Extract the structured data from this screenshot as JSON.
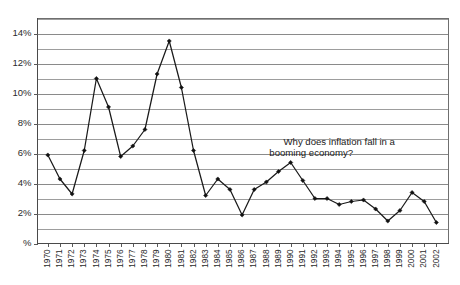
{
  "chart_data": {
    "type": "line",
    "title": "",
    "subtitle": "",
    "xlabel": "",
    "ylabel": "",
    "ylim": [
      0,
      15
    ],
    "ytick_values": [
      0,
      2,
      4,
      6,
      8,
      10,
      12,
      14
    ],
    "ytick_labels": [
      "%",
      "2%",
      "4%",
      "6%",
      "8%",
      "10%",
      "12%",
      "14%"
    ],
    "yminor_values": [
      1,
      3,
      5,
      7,
      9,
      11,
      13,
      15
    ],
    "grid": true,
    "grid_axis": "y",
    "legend": false,
    "legend_position": "none",
    "marker": "diamond",
    "categories": [
      "1970",
      "1971",
      "1972",
      "1973",
      "1974",
      "1975",
      "1976",
      "1977",
      "1978",
      "1979",
      "1980",
      "1981",
      "1982",
      "1983",
      "1984",
      "1985",
      "1986",
      "1987",
      "1988",
      "1989",
      "1990",
      "1991",
      "1992",
      "1993",
      "1994",
      "1995",
      "1996",
      "1997",
      "1998",
      "1999",
      "2000",
      "2001",
      "2002"
    ],
    "values": [
      5.9,
      4.3,
      3.3,
      6.2,
      11.0,
      9.1,
      5.8,
      6.5,
      7.6,
      11.3,
      13.5,
      10.4,
      6.2,
      3.2,
      4.3,
      3.6,
      1.9,
      3.6,
      4.1,
      4.8,
      5.4,
      4.2,
      3.0,
      3.0,
      2.6,
      2.8,
      2.9,
      2.3,
      1.5,
      2.2,
      3.4,
      2.8,
      1.4
    ],
    "series": [
      {
        "name": "Inflation rate",
        "values": [
          5.9,
          4.3,
          3.3,
          6.2,
          11.0,
          9.1,
          5.8,
          6.5,
          7.6,
          11.3,
          13.5,
          10.4,
          6.2,
          3.2,
          4.3,
          3.6,
          1.9,
          3.6,
          4.1,
          4.8,
          5.4,
          4.2,
          3.0,
          3.0,
          2.6,
          2.8,
          2.9,
          2.3,
          1.5,
          2.2,
          3.4,
          2.8,
          1.4
        ]
      }
    ],
    "annotations": [
      {
        "name": "inflation-question",
        "line1": "Why does inflation fall in a",
        "line2": "booming economy?",
        "x_year": "1994",
        "y_percent": 6.6
      }
    ],
    "colors": {
      "line": "#1a1a1a",
      "marker": "#111111",
      "grid": "#8a8a8a",
      "frame": "#6f6f6f",
      "background": "#ffffff",
      "text": "#2b2b2b"
    }
  }
}
